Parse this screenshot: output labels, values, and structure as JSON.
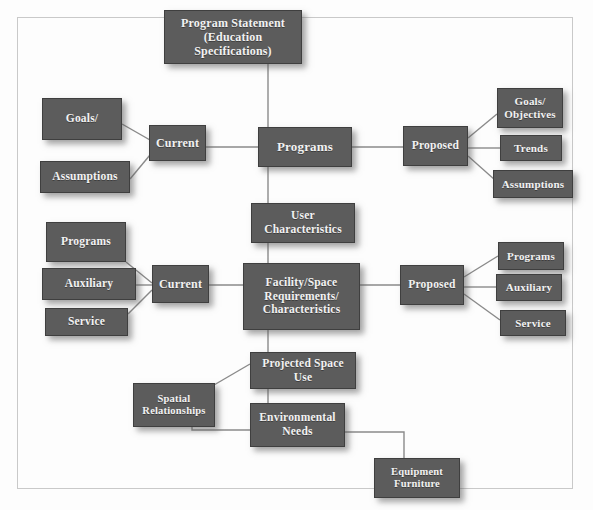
{
  "diagram": {
    "frame_color": "#c9c9c9",
    "node_fill_color": "#5c5c5c",
    "node_text_color": "#f2f2f2",
    "connector_color": "#8a8a8a",
    "background_color": "#fdfdfd",
    "nodes": [
      {
        "id": "program-statement",
        "label": "Program Statement\n(Education Specifications)"
      },
      {
        "id": "goals-left",
        "label": "Goals/"
      },
      {
        "id": "assumptions-left",
        "label": "Assumptions"
      },
      {
        "id": "current-top",
        "label": "Current"
      },
      {
        "id": "programs",
        "label": "Programs"
      },
      {
        "id": "proposed-top",
        "label": "Proposed"
      },
      {
        "id": "goals-objectives",
        "label": "Goals/\nObjectives"
      },
      {
        "id": "trends",
        "label": "Trends"
      },
      {
        "id": "assumptions-right",
        "label": "Assumptions"
      },
      {
        "id": "user-characteristics",
        "label": "User\nCharacteristics"
      },
      {
        "id": "programs-left",
        "label": "Programs"
      },
      {
        "id": "auxiliary-left",
        "label": "Auxiliary"
      },
      {
        "id": "service-left",
        "label": "Service"
      },
      {
        "id": "current-bottom",
        "label": "Current"
      },
      {
        "id": "facility-space",
        "label": "Facility/Space\nRequirements/\nCharacteristics"
      },
      {
        "id": "proposed-bottom",
        "label": "Proposed"
      },
      {
        "id": "programs-right",
        "label": "Programs"
      },
      {
        "id": "auxiliary-right",
        "label": "Auxiliary"
      },
      {
        "id": "service-right",
        "label": "Service"
      },
      {
        "id": "projected-space-use",
        "label": "Projected Space\nUse"
      },
      {
        "id": "spatial-relationships",
        "label": "Spatial\nRelationships"
      },
      {
        "id": "environmental-needs",
        "label": "Environmental\nNeeds"
      },
      {
        "id": "equipment-furniture",
        "label": "Equipment\nFurniture"
      }
    ]
  }
}
